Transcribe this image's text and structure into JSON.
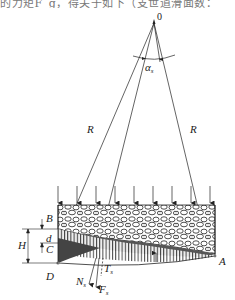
{
  "header": {
    "clipped_text": "的力矩F_g，得关于如下（支世道滑面数："
  },
  "diagram": {
    "apex_label": "0",
    "angle_label": "α",
    "angle_subscript": "s",
    "radius_label_left": "R",
    "radius_label_right": "R",
    "point_labels": {
      "A": "A",
      "B": "B",
      "C": "C",
      "D": "D"
    },
    "dimension_labels": {
      "H": "H",
      "d": "d"
    },
    "force_labels": {
      "N": "N",
      "T": "T",
      "F": "F",
      "subscript": "s"
    },
    "load_arrow_count": 9,
    "colors": {
      "line": "#222222",
      "hatch_fill": "#555555",
      "rubble_fill": "#ffffff"
    }
  }
}
